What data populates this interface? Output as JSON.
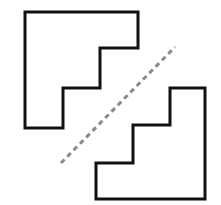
{
  "figure": {
    "canvas": {
      "width": 221,
      "height": 205,
      "background_color": "#ffffff"
    },
    "shapes": [
      {
        "name": "upper-left-staircase",
        "description": "Staircase-shaped polygon in the upper-left, descending in two steps from the top-right toward the bottom-left",
        "stroke_color": "#111111",
        "fill_color": "#ffffff",
        "stroke_width": 3,
        "points": "25,12 138,12 138,48 100,48 100,88 63,88 63,128 25,128",
        "vertices": [
          [
            25,
            12
          ],
          [
            138,
            12
          ],
          [
            138,
            48
          ],
          [
            100,
            48
          ],
          [
            100,
            88
          ],
          [
            63,
            88
          ],
          [
            63,
            128
          ],
          [
            25,
            128
          ]
        ]
      },
      {
        "name": "lower-right-staircase",
        "description": "Staircase-shaped polygon in the lower-right, congruent to the upper-left shape rotated 180 degrees",
        "stroke_color": "#111111",
        "fill_color": "#ffffff",
        "stroke_width": 3,
        "points": "205,88 205,199 96,199 96,163 133,163 133,125 170,125 170,88",
        "vertices": [
          [
            205,
            88
          ],
          [
            205,
            199
          ],
          [
            96,
            199
          ],
          [
            96,
            163
          ],
          [
            133,
            163
          ],
          [
            133,
            125
          ],
          [
            170,
            125
          ],
          [
            170,
            88
          ]
        ]
      }
    ],
    "cut_line": {
      "name": "dashed-diagonal-cut-line",
      "description": "Gray dashed line running diagonally from lower-left to upper-right between the two staircase shapes",
      "stroke_color": "#8a8a8a",
      "stroke_width": 3,
      "dash_pattern": "5 4",
      "start": [
        61,
        163
      ],
      "end": [
        175,
        47
      ]
    }
  }
}
